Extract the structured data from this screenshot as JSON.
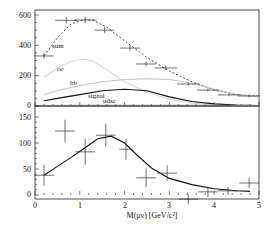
{
  "chart_data": [
    {
      "type": "line",
      "panel": "top",
      "title": "",
      "xlabel": "",
      "ylabel": "",
      "xlim": [
        0,
        5
      ],
      "ylim": [
        0,
        600
      ],
      "yticks": [
        0,
        200,
        400,
        600
      ],
      "ytick_labels": [
        "0",
        "200",
        "400",
        "600"
      ],
      "grid": false,
      "data_points": {
        "name": "data",
        "x": [
          0.2,
          0.7,
          1.12,
          1.55,
          2.12,
          2.48,
          2.92,
          3.42,
          3.86,
          4.33,
          4.78
        ],
        "y": [
          330,
          565,
          567,
          500,
          382,
          277,
          251,
          145,
          105,
          73,
          66
        ],
        "xerr": [
          0.22,
          0.25,
          0.25,
          0.22,
          0.22,
          0.22,
          0.25,
          0.25,
          0.25,
          0.25,
          0.25
        ],
        "yerr": [
          18,
          22,
          22,
          20,
          18,
          16,
          15,
          12,
          10,
          9,
          8
        ]
      },
      "series": [
        {
          "name": "sum",
          "label": "sum",
          "style": "dashed",
          "color": "#333333",
          "x": [
            0.2,
            0.5,
            0.8,
            1.1,
            1.3,
            1.6,
            2.0,
            2.5,
            3.0,
            3.5,
            4.0,
            4.5,
            5.0
          ],
          "y": [
            330,
            450,
            540,
            570,
            565,
            520,
            430,
            320,
            230,
            160,
            105,
            75,
            65
          ]
        },
        {
          "name": "cc",
          "label": "cc",
          "style": "solid",
          "color": "#d6d6d6",
          "x": [
            0.2,
            0.5,
            0.8,
            1.1,
            1.3,
            1.6,
            2.0,
            2.5,
            3.0,
            3.5,
            4.0,
            4.5,
            5.0
          ],
          "y": [
            190,
            250,
            295,
            310,
            295,
            240,
            160,
            90,
            45,
            20,
            8,
            3,
            1
          ]
        },
        {
          "name": "bb",
          "label": "bb",
          "style": "solid",
          "color": "#c4c4c4",
          "x": [
            0.2,
            0.5,
            1.0,
            1.5,
            2.0,
            2.5,
            3.0,
            3.5,
            4.0,
            4.5,
            5.0
          ],
          "y": [
            75,
            100,
            135,
            160,
            175,
            180,
            175,
            150,
            110,
            75,
            60
          ]
        },
        {
          "name": "signal",
          "label": "signal",
          "style": "solid",
          "color": "#111111",
          "x": [
            0.2,
            0.5,
            1.0,
            1.5,
            2.0,
            2.5,
            3.0,
            3.5,
            4.0,
            4.5,
            5.0
          ],
          "y": [
            35,
            50,
            75,
            100,
            110,
            100,
            60,
            30,
            14,
            6,
            3
          ]
        },
        {
          "name": "udsc",
          "label": "udsc",
          "style": "solid",
          "color": "#999999",
          "x": [
            0.2,
            1.0,
            2.0,
            3.0,
            4.0,
            5.0
          ],
          "y": [
            3,
            4,
            5,
            5,
            4,
            3
          ]
        }
      ],
      "annotations": [
        "sum",
        "cc",
        "bb",
        "signal",
        "udsc"
      ]
    },
    {
      "type": "line",
      "panel": "bottom",
      "title": "",
      "xlabel": "M(μν) [GeV/c²]",
      "ylabel": "",
      "xlim": [
        0,
        5
      ],
      "ylim": [
        0,
        150
      ],
      "xticks": [
        0,
        1,
        2,
        3,
        4,
        5
      ],
      "xtick_labels": [
        "0",
        "1",
        "2",
        "3",
        "4",
        "5"
      ],
      "yticks": [
        0,
        50,
        100,
        150
      ],
      "ytick_labels": [
        "0",
        "50",
        "100",
        "150"
      ],
      "grid": false,
      "data_points": {
        "name": "background-subtracted data",
        "x": [
          0.2,
          0.67,
          1.12,
          1.58,
          2.03,
          2.48,
          2.95,
          3.42,
          3.86,
          4.31,
          4.78
        ],
        "y": [
          38,
          123,
          83,
          115,
          88,
          33,
          42,
          -8,
          6,
          8,
          23
        ],
        "xerr": [
          0.22,
          0.22,
          0.22,
          0.22,
          0.15,
          0.22,
          0.22,
          0.22,
          0.22,
          0.22,
          0.22
        ],
        "yerr": [
          20,
          22,
          25,
          22,
          20,
          18,
          15,
          10,
          10,
          8,
          10
        ]
      },
      "series": [
        {
          "name": "signal fit",
          "style": "solid",
          "color": "#111111",
          "x": [
            0.2,
            0.5,
            0.8,
            1.1,
            1.4,
            1.7,
            2.0,
            2.3,
            2.6,
            3.0,
            3.5,
            4.0,
            4.5,
            4.8
          ],
          "y": [
            38,
            55,
            72,
            90,
            108,
            113,
            100,
            75,
            52,
            32,
            20,
            12,
            8,
            7
          ]
        }
      ]
    }
  ]
}
